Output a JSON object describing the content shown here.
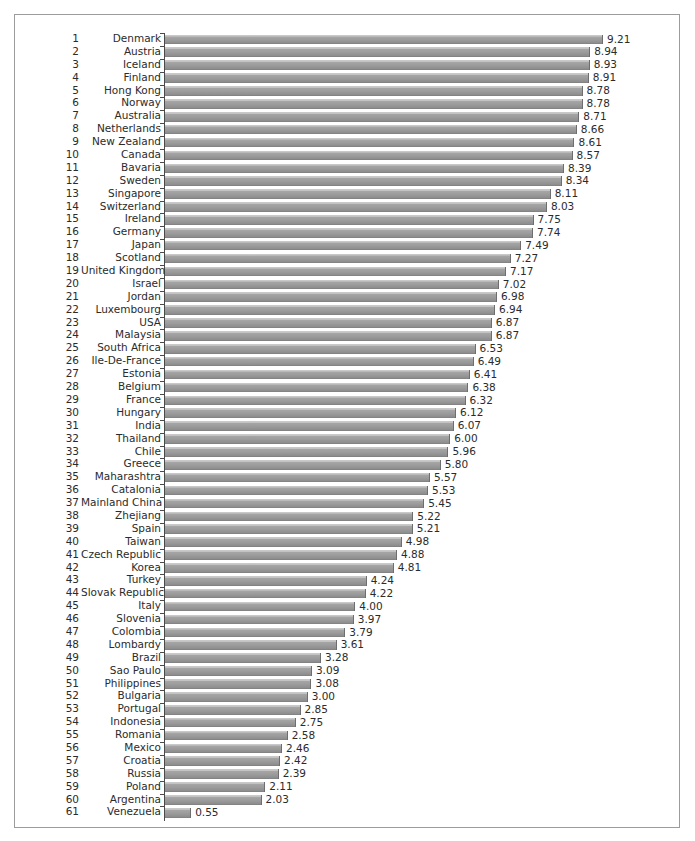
{
  "chart_data": {
    "type": "bar",
    "orientation": "horizontal",
    "title": "",
    "subtitle": "",
    "xlabel": "",
    "ylabel": "",
    "xlim": [
      0,
      9.21
    ],
    "grid": false,
    "legend": null,
    "value_labels": true,
    "bar_color": "#9b9b9b",
    "categories": [
      "Denmark",
      "Austria",
      "Iceland",
      "Finland",
      "Hong Kong",
      "Norway",
      "Australia",
      "Netherlands",
      "New Zealand",
      "Canada",
      "Bavaria",
      "Sweden",
      "Singapore",
      "Switzerland",
      "Ireland",
      "Germany",
      "Japan",
      "Scotland",
      "United Kingdom",
      "Israel",
      "Jordan",
      "Luxembourg",
      "USA",
      "Malaysia",
      "South Africa",
      "Ile-De-France",
      "Estonia",
      "Belgium",
      "France",
      "Hungary",
      "India",
      "Thailand",
      "Chile",
      "Greece",
      "Maharashtra",
      "Catalonia",
      "Mainland China",
      "Zhejiang",
      "Spain",
      "Taiwan",
      "Czech Republic",
      "Korea",
      "Turkey",
      "Slovak Republic",
      "Italy",
      "Slovenia",
      "Colombia",
      "Lombardy",
      "Brazil",
      "Sao Paulo",
      "Philippines",
      "Bulgaria",
      "Portugal",
      "Indonesia",
      "Romania",
      "Mexico",
      "Croatia",
      "Russia",
      "Poland",
      "Argentina",
      "Venezuela"
    ],
    "values": [
      9.21,
      8.94,
      8.93,
      8.91,
      8.78,
      8.78,
      8.71,
      8.66,
      8.61,
      8.57,
      8.39,
      8.34,
      8.11,
      8.03,
      7.75,
      7.74,
      7.49,
      7.27,
      7.17,
      7.02,
      6.98,
      6.94,
      6.87,
      6.87,
      6.53,
      6.49,
      6.41,
      6.38,
      6.32,
      6.12,
      6.07,
      6.0,
      5.96,
      5.8,
      5.57,
      5.53,
      5.45,
      5.22,
      5.21,
      4.98,
      4.88,
      4.81,
      4.24,
      4.22,
      4.0,
      3.97,
      3.79,
      3.61,
      3.28,
      3.09,
      3.08,
      3.0,
      2.85,
      2.75,
      2.58,
      2.46,
      2.42,
      2.39,
      2.11,
      2.03,
      0.55
    ],
    "value_label_strings": [
      "9.21",
      "8.94",
      "8.93",
      "8.91",
      "8.78",
      "8.78",
      "8.71",
      "8.66",
      "8.61",
      "8.57",
      "8.39",
      "8.34",
      "8.11",
      "8.03",
      "7.75",
      "7.74",
      "7.49",
      "7.27",
      "7.17",
      "7.02",
      "6.98",
      "6.94",
      "6.87",
      "6.87",
      "6.53",
      "6.49",
      "6.41",
      "6.38",
      "6.32",
      "6.12",
      "6.07",
      "6.00",
      "5.96",
      "5.80",
      "5.57",
      "5.53",
      "5.45",
      "5.22",
      "5.21",
      "4.98",
      "4.88",
      "4.81",
      "4.24",
      "4.22",
      "4.00",
      "3.97",
      "3.79",
      "3.61",
      "3.28",
      "3.09",
      "3.08",
      "3.00",
      "2.85",
      "2.75",
      "2.58",
      "2.46",
      "2.42",
      "2.39",
      "2.11",
      "2.03",
      "0.55"
    ],
    "ranks": [
      "1",
      "2",
      "3",
      "4",
      "5",
      "6",
      "7",
      "8",
      "9",
      "10",
      "11",
      "12",
      "13",
      "14",
      "15",
      "16",
      "17",
      "18",
      "19",
      "20",
      "21",
      "22",
      "23",
      "24",
      "25",
      "26",
      "27",
      "28",
      "29",
      "30",
      "31",
      "32",
      "33",
      "34",
      "35",
      "36",
      "37",
      "38",
      "39",
      "40",
      "41",
      "42",
      "43",
      "44",
      "45",
      "46",
      "47",
      "48",
      "49",
      "50",
      "51",
      "52",
      "53",
      "54",
      "55",
      "56",
      "57",
      "58",
      "59",
      "60",
      "61"
    ]
  }
}
